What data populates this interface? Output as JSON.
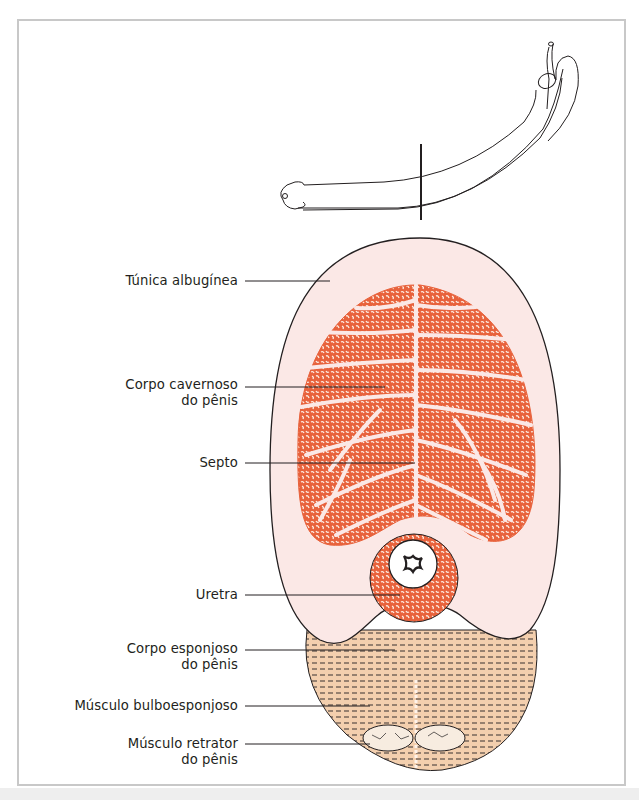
{
  "figure": {
    "type": "anatomical cross-section diagram",
    "frame_color": "#c8c8c8",
    "colors": {
      "tunica": "#fbe8e6",
      "cavernous_tissue": "#e8623c",
      "spongy_tissue": "#e8623c",
      "muscle": "#f3cfae",
      "outline": "#231f20"
    },
    "labels": [
      {
        "id": "tunica-albuginea",
        "lines": [
          "Túnica albugínea"
        ]
      },
      {
        "id": "corpo-cavernoso",
        "lines": [
          "Corpo cavernoso",
          "do pênis"
        ]
      },
      {
        "id": "septo",
        "lines": [
          "Septo"
        ]
      },
      {
        "id": "uretra",
        "lines": [
          "Uretra"
        ]
      },
      {
        "id": "corpo-esponjoso",
        "lines": [
          "Corpo esponjoso",
          "do pênis"
        ]
      },
      {
        "id": "musculo-bulboesponjoso",
        "lines": [
          "Músculo bulboesponjoso"
        ]
      },
      {
        "id": "musculo-retrator",
        "lines": [
          "Músculo retrator",
          "do pênis"
        ]
      }
    ]
  }
}
